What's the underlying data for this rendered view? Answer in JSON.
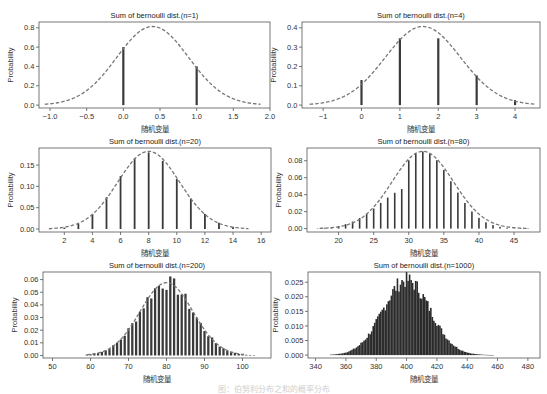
{
  "figure": {
    "caption": "图：伯努利分布之和的概率分布"
  },
  "chart_data": [
    {
      "type": "bar",
      "title": "Sum of bernoulli dist.(n=1)",
      "xlabel": "随机变量",
      "ylabel": "Probability",
      "n": 1,
      "p": 0.4,
      "xlim": [
        -1.15,
        2.0
      ],
      "ylim": [
        -0.03,
        0.86
      ],
      "xticks": [
        -1.0,
        -0.5,
        0.0,
        0.5,
        1.0,
        1.5,
        2.0
      ],
      "xtick_labels": [
        "−1.0",
        "−0.5",
        "0.0",
        "0.5",
        "1.0",
        "1.5",
        "2.0"
      ],
      "yticks": [
        0.0,
        0.2,
        0.4,
        0.6,
        0.8
      ],
      "ytick_labels": [
        "0.0",
        "0.2",
        "0.4",
        "0.6",
        "0.8"
      ],
      "x": [
        0,
        1
      ],
      "values": [
        0.6,
        0.4
      ],
      "normal_curve": {
        "mean": 0.4,
        "sd": 0.49,
        "x_range": [
          -1.07,
          1.87
        ]
      },
      "grid": false,
      "legend": null
    },
    {
      "type": "bar",
      "title": "Sum of bernoulli dist.(n=4)",
      "xlabel": "随机变量",
      "ylabel": "Probability",
      "n": 4,
      "p": 0.4,
      "xlim": [
        -1.55,
        4.65
      ],
      "ylim": [
        -0.015,
        0.43
      ],
      "xticks": [
        -1,
        0,
        1,
        2,
        3,
        4
      ],
      "xtick_labels": [
        "−1",
        "0",
        "1",
        "2",
        "3",
        "4"
      ],
      "yticks": [
        0.0,
        0.1,
        0.2,
        0.3,
        0.4
      ],
      "ytick_labels": [
        "0.0",
        "0.1",
        "0.2",
        "0.3",
        "0.4"
      ],
      "x": [
        0,
        1,
        2,
        3,
        4
      ],
      "values": [
        0.1296,
        0.3456,
        0.3456,
        0.1536,
        0.0256
      ],
      "normal_curve": {
        "mean": 1.6,
        "sd": 0.98,
        "x_range": [
          -1.35,
          4.55
        ]
      },
      "grid": false,
      "legend": null
    },
    {
      "type": "bar",
      "title": "Sum of bernoulli dist.(n=20)",
      "xlabel": "随机变量",
      "ylabel": "Probability",
      "n": 20,
      "p": 0.4,
      "xlim": [
        0.2,
        16.7
      ],
      "ylim": [
        -0.007,
        0.19
      ],
      "xticks": [
        2,
        4,
        6,
        8,
        10,
        12,
        14,
        16
      ],
      "xtick_labels": [
        "2",
        "4",
        "6",
        "8",
        "10",
        "12",
        "14",
        "16"
      ],
      "yticks": [
        0.0,
        0.05,
        0.1,
        0.15
      ],
      "ytick_labels": [
        "0.00",
        "0.05",
        "0.10",
        "0.15"
      ],
      "x": [
        1,
        2,
        3,
        4,
        5,
        6,
        7,
        8,
        9,
        10,
        11,
        12,
        13,
        14,
        15
      ],
      "values": [
        0.0005,
        0.0031,
        0.0123,
        0.035,
        0.0746,
        0.1244,
        0.1659,
        0.1797,
        0.1597,
        0.1171,
        0.071,
        0.0355,
        0.0146,
        0.0049,
        0.0013
      ],
      "normal_curve": {
        "mean": 8,
        "sd": 2.19,
        "x_range": [
          0.9,
          15.1
        ]
      },
      "grid": false,
      "legend": null
    },
    {
      "type": "bar",
      "title": "Sum of bernoulli dist.(n=80)",
      "xlabel": "随机变量",
      "ylabel": "Probability",
      "n": 80,
      "p": 0.4,
      "xlim": [
        15.5,
        48.7
      ],
      "ylim": [
        -0.004,
        0.095
      ],
      "xticks": [
        20,
        25,
        30,
        35,
        40,
        45
      ],
      "xtick_labels": [
        "20",
        "25",
        "30",
        "35",
        "40",
        "45"
      ],
      "yticks": [
        0.0,
        0.02,
        0.04,
        0.06,
        0.08
      ],
      "ytick_labels": [
        "0.00",
        "0.02",
        "0.04",
        "0.06",
        "0.08"
      ],
      "x": [
        17,
        18,
        19,
        20,
        21,
        22,
        23,
        24,
        25,
        26,
        27,
        28,
        29,
        30,
        31,
        32,
        33,
        34,
        35,
        36,
        37,
        38,
        39,
        40,
        41,
        42,
        43,
        44,
        45,
        46,
        47
      ],
      "values": [
        0.0004,
        0.0009,
        0.0017,
        0.0031,
        0.0052,
        0.0083,
        0.0125,
        0.0177,
        0.0236,
        0.0303,
        0.0366,
        0.0422,
        0.0466,
        0.0805,
        0.0883,
        0.091,
        0.0883,
        0.0806,
        0.0691,
        0.0558,
        0.0424,
        0.0302,
        0.0202,
        0.0127,
        0.0074,
        0.0041,
        0.0021,
        0.001,
        0.0005,
        0.0002,
        0.0001
      ],
      "normal_curve": {
        "mean": 32,
        "sd": 4.38,
        "x_range": [
          17.3,
          47.0
        ]
      },
      "grid": false,
      "legend": null
    },
    {
      "type": "bar",
      "title": "Sum of bernoulli dist.(n=200)",
      "xlabel": "随机变量",
      "ylabel": "Probability",
      "n": 200,
      "p": 0.4,
      "xlim": [
        47.5,
        107.5
      ],
      "ylim": [
        -0.002,
        0.066
      ],
      "xticks": [
        50,
        60,
        70,
        80,
        90,
        100
      ],
      "xtick_labels": [
        "50",
        "60",
        "70",
        "80",
        "90",
        "100"
      ],
      "yticks": [
        0.0,
        0.01,
        0.02,
        0.03,
        0.04,
        0.05,
        0.06
      ],
      "ytick_labels": [
        "0.00",
        "0.01",
        "0.02",
        "0.03",
        "0.04",
        "0.05",
        "0.06"
      ],
      "x_range": [
        59,
        103
      ],
      "mean": 80,
      "sd": 6.93,
      "peak": 0.0576,
      "normal_curve": {
        "mean": 80,
        "sd": 6.93,
        "x_range": [
          59,
          101
        ]
      },
      "grid": false,
      "legend": null
    },
    {
      "type": "bar",
      "title": "Sum of bernoulli dist.(n=1000)",
      "xlabel": "随机变量",
      "ylabel": "Probability",
      "n": 1000,
      "p": 0.4,
      "xlim": [
        335,
        488
      ],
      "ylim": [
        -0.001,
        0.0285
      ],
      "xticks": [
        340,
        360,
        380,
        400,
        420,
        440,
        460,
        480
      ],
      "xtick_labels": [
        "340",
        "360",
        "380",
        "400",
        "420",
        "440",
        "460",
        "480"
      ],
      "yticks": [
        0.0,
        0.005,
        0.01,
        0.015,
        0.02,
        0.025
      ],
      "ytick_labels": [
        "0.000",
        "0.005",
        "0.010",
        "0.015",
        "0.020",
        "0.025"
      ],
      "x_range": [
        350,
        457
      ],
      "mean": 400,
      "sd": 15.49,
      "peak": 0.0257,
      "normal_curve": null,
      "grid": false,
      "legend": null
    }
  ]
}
